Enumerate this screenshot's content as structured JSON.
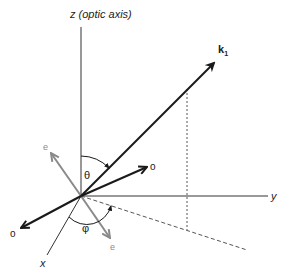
{
  "diagram": {
    "type": "3D coordinate diagram (wave vector in uniaxial crystal)",
    "axes": {
      "z_label": "z (optic axis)",
      "y_label": "y",
      "x_label": "x"
    },
    "vectors": {
      "wave_vector_label": "k",
      "wave_vector_subscript": "1",
      "ordinary_label": "o",
      "extraordinary_label": "e"
    },
    "angles": {
      "polar": "θ",
      "azimuthal": "φ"
    },
    "colors": {
      "axis": "#333333",
      "vector": "#1a1a1a",
      "extraordinary": "#8a8a8a",
      "projection": "#555555",
      "background": "#ffffff"
    }
  }
}
